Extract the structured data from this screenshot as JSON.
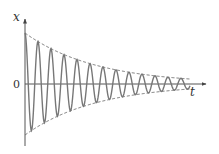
{
  "figure": {
    "axes": {
      "y_label": "x",
      "x_label": "t",
      "origin_label": "0"
    },
    "colors": {
      "curve": "#777777",
      "envelope": "#666666",
      "axis": "#555555"
    },
    "geometry": {
      "origin": [
        25,
        84
      ],
      "x_axis_end": 206,
      "y_axis_top": 19,
      "y_axis_bottom": 146,
      "initial_amplitude_px": 51,
      "decay_per_px": 0.0141,
      "period_px": 13,
      "t_end_px": 190
    }
  },
  "chart_data": {
    "type": "line",
    "title": "",
    "xlabel": "t",
    "ylabel": "x",
    "grid": false,
    "legend": "none",
    "series": [
      {
        "name": "x(t) = A·e^(-βt)·cos(ωt)",
        "style": "solid"
      },
      {
        "name": "+A·e^(-βt) envelope",
        "style": "dashed"
      },
      {
        "name": "-A·e^(-βt) envelope",
        "style": "dashed"
      }
    ],
    "annotations": [
      "0 at origin"
    ],
    "approx_cycles": 13
  }
}
